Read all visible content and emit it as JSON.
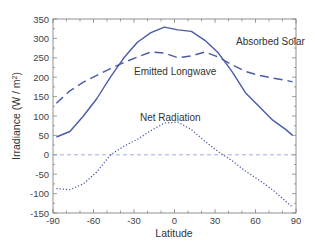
{
  "chart_data": {
    "type": "line",
    "title": "",
    "xlabel": "Latitude",
    "ylabel": "Irradiance  (W / m²)",
    "xlim": [
      -90,
      90
    ],
    "ylim": [
      -150,
      350
    ],
    "x_ticks": [
      -90,
      -60,
      -30,
      0,
      30,
      60,
      90
    ],
    "y_ticks": [
      350,
      300,
      250,
      200,
      150,
      100,
      50,
      0,
      -50,
      -100,
      -150
    ],
    "grid": false,
    "legend": "none (inline annotations)",
    "reference_line": {
      "y": 0,
      "style": "dashed",
      "color": "#8a9ad0"
    },
    "x": [
      -87.5,
      -77.5,
      -67.5,
      -57.5,
      -47.5,
      -37.5,
      -27.5,
      -17.5,
      -7.5,
      2.5,
      12.5,
      22.5,
      32.5,
      42.5,
      52.5,
      62.5,
      72.5,
      82.5,
      87.5
    ],
    "series": [
      {
        "name": "Absorbed Solar",
        "style": "solid",
        "color": "#4a5aa8",
        "values": [
          46,
          60,
          100,
          145,
          200,
          250,
          290,
          315,
          329,
          322,
          318,
          295,
          262,
          215,
          160,
          125,
          90,
          65,
          50
        ]
      },
      {
        "name": "Emitted Longwave",
        "style": "dashed",
        "color": "#4a5aa8",
        "values": [
          133,
          165,
          187,
          205,
          222,
          238,
          252,
          265,
          262,
          250,
          255,
          265,
          252,
          232,
          215,
          205,
          198,
          192,
          188
        ]
      },
      {
        "name": "Net Radiation",
        "style": "dotted",
        "color": "#4a5aa8",
        "values": [
          -87,
          -90,
          -75,
          -44,
          0,
          22,
          40,
          62,
          82,
          84,
          65,
          35,
          8,
          -15,
          -42,
          -65,
          -90,
          -120,
          -135
        ]
      }
    ],
    "annotations": [
      {
        "text": "Absorbed Solar",
        "x": 58,
        "y": 290
      },
      {
        "text": "Emitted Longwave",
        "x": -28,
        "y": 215
      },
      {
        "text": "Net Radiation",
        "x": -24,
        "y": 93
      }
    ]
  },
  "labels": {
    "xlabel": "Latitude",
    "ylabel_main": "Irradiance  (W / m",
    "ylabel_sup": "2",
    "ylabel_end": ")",
    "annotation_solar": "Absorbed Solar",
    "annotation_longwave": "Emitted Longwave",
    "annotation_net": "Net Radiation"
  }
}
